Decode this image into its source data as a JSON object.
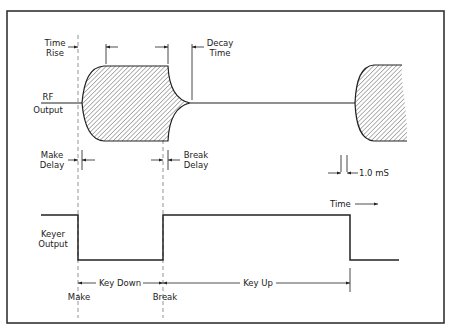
{
  "diagram": {
    "type": "timing-diagram",
    "signals": [
      {
        "name": "RF Output",
        "label_lines": [
          "RF",
          "Output"
        ]
      },
      {
        "name": "Keyer Output",
        "label_lines": [
          "Keyer",
          "Output"
        ]
      }
    ],
    "annotations": {
      "time_rise": [
        "Time",
        "Rise"
      ],
      "decay_time": [
        "Decay",
        "Time"
      ],
      "make_delay": [
        "Make",
        "Delay"
      ],
      "break_delay": [
        "Break",
        "Delay"
      ],
      "scale": "1.0 mS",
      "time_axis": "Time",
      "key_down": "Key Down",
      "key_up": "Key Up",
      "make": "Make",
      "break": "Break"
    },
    "colors": {
      "line": "#2a2a2a",
      "dashed": "#888888",
      "hatch": "#555555",
      "background": "#ffffff"
    }
  }
}
